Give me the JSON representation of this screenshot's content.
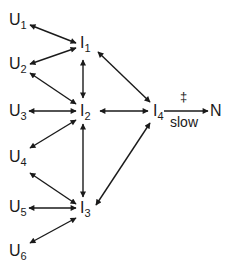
{
  "diagram": {
    "type": "reaction-mechanism",
    "nodes": [
      {
        "id": "U1",
        "base": "U",
        "sub": "1",
        "x": 11,
        "y": 11
      },
      {
        "id": "U2",
        "base": "U",
        "sub": "2",
        "x": 11,
        "y": 56
      },
      {
        "id": "U3",
        "base": "U",
        "sub": "3",
        "x": 11,
        "y": 103
      },
      {
        "id": "U4",
        "base": "U",
        "sub": "4",
        "x": 11,
        "y": 150
      },
      {
        "id": "U5",
        "base": "U",
        "sub": "5",
        "x": 11,
        "y": 199
      },
      {
        "id": "U6",
        "base": "U",
        "sub": "6",
        "x": 11,
        "y": 244
      },
      {
        "id": "I1",
        "base": "I",
        "sub": "1",
        "x": 81,
        "y": 36
      },
      {
        "id": "I2",
        "base": "I",
        "sub": "2",
        "x": 81,
        "y": 103
      },
      {
        "id": "I3",
        "base": "I",
        "sub": "3",
        "x": 81,
        "y": 200
      },
      {
        "id": "I4",
        "base": "I",
        "sub": "4",
        "x": 154,
        "y": 103
      },
      {
        "id": "N",
        "base": "N",
        "sub": "",
        "x": 210,
        "y": 103
      }
    ],
    "edges": [
      {
        "from": "U1",
        "to": "I1",
        "type": "bidirectional"
      },
      {
        "from": "U2",
        "to": "I1",
        "type": "bidirectional"
      },
      {
        "from": "U2",
        "to": "I2",
        "type": "bidirectional"
      },
      {
        "from": "U3",
        "to": "I2",
        "type": "bidirectional"
      },
      {
        "from": "U4",
        "to": "I2",
        "type": "bidirectional"
      },
      {
        "from": "U4",
        "to": "I3",
        "type": "bidirectional"
      },
      {
        "from": "U5",
        "to": "I3",
        "type": "bidirectional"
      },
      {
        "from": "U6",
        "to": "I3",
        "type": "bidirectional"
      },
      {
        "from": "I1",
        "to": "I2",
        "type": "bidirectional"
      },
      {
        "from": "I2",
        "to": "I3",
        "type": "bidirectional"
      },
      {
        "from": "I1",
        "to": "I4",
        "type": "bidirectional"
      },
      {
        "from": "I2",
        "to": "I4",
        "type": "bidirectional"
      },
      {
        "from": "I3",
        "to": "I4",
        "type": "bidirectional"
      },
      {
        "from": "I4",
        "to": "N",
        "type": "forward",
        "label_above": "‡",
        "label_below": "slow"
      }
    ],
    "labels": {
      "transition_state": "‡",
      "rate_step": "slow"
    },
    "colors": {
      "line": "#1a1a1a",
      "text": "#1a1a1a",
      "background": "#ffffff"
    }
  }
}
